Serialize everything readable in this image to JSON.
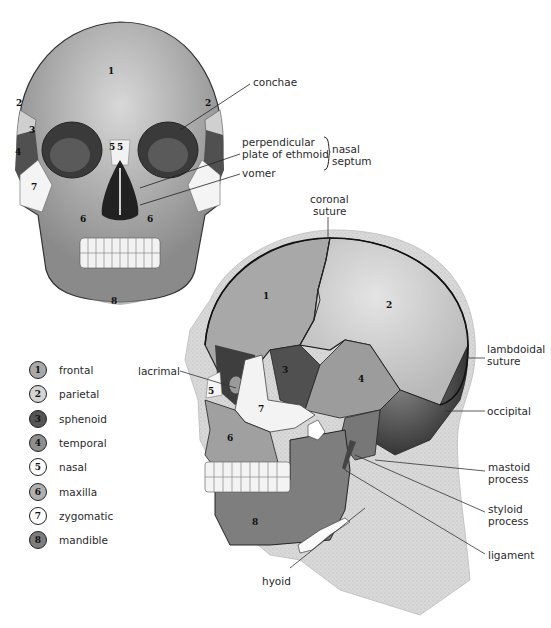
{
  "diagram": {
    "front_view": {
      "region_numbers": [
        "1",
        "2",
        "2",
        "3",
        "4",
        "5",
        "5",
        "6",
        "6",
        "7",
        "8"
      ],
      "callouts": {
        "conchae": "conchae",
        "perpendicular_plate": [
          "perpendicular",
          "plate of ethmoid"
        ],
        "vomer": "vomer",
        "nasal_septum_group": [
          "nasal",
          "septum"
        ]
      }
    },
    "side_view": {
      "region_numbers": [
        "1",
        "2",
        "3",
        "4",
        "5",
        "6",
        "7",
        "8"
      ],
      "callouts": {
        "coronal_suture": [
          "coronal",
          "suture"
        ],
        "lambdoidal_suture": [
          "lambdoidal",
          "suture"
        ],
        "occipital": "occipital",
        "mastoid_process": [
          "mastoid",
          "process"
        ],
        "styloid_process": [
          "styloid",
          "process"
        ],
        "ligament": "ligament",
        "lacrimal": "lacrimal",
        "hyoid": "hyoid"
      }
    },
    "legend": [
      {
        "number": "1",
        "label": "frontal",
        "fill": "#a9a9a9"
      },
      {
        "number": "2",
        "label": "parietal",
        "fill": "#d4d4d4"
      },
      {
        "number": "3",
        "label": "sphenoid",
        "fill": "#555555"
      },
      {
        "number": "4",
        "label": "temporal",
        "fill": "#8f8f8f"
      },
      {
        "number": "5",
        "label": "nasal",
        "fill": "#ffffff"
      },
      {
        "number": "6",
        "label": "maxilla",
        "fill": "#b0b0b0"
      },
      {
        "number": "7",
        "label": "zygomatic",
        "fill": "#ffffff"
      },
      {
        "number": "8",
        "label": "mandible",
        "fill": "#7d7d7d"
      }
    ]
  }
}
